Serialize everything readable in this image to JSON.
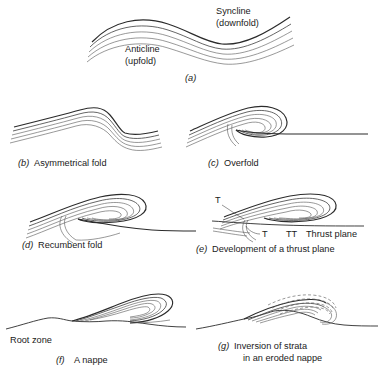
{
  "figure": {
    "background": "#ffffff",
    "ink": "#2b2b2b",
    "panels": [
      {
        "key": "a",
        "tag": "(a)",
        "caption": "",
        "annotations": [
          {
            "name": "syncline",
            "line1": "Syncline",
            "line2": "(downfold)"
          },
          {
            "name": "anticline",
            "line1": "Anticline",
            "line2": "(upfold)"
          }
        ]
      },
      {
        "key": "b",
        "tag": "(b)",
        "caption": "Asymmetrical fold",
        "annotations": []
      },
      {
        "key": "c",
        "tag": "(c)",
        "caption": "Overfold",
        "annotations": []
      },
      {
        "key": "d",
        "tag": "(d)",
        "caption": "Recumbent fold",
        "annotations": []
      },
      {
        "key": "e",
        "tag": "(e)",
        "caption": "Development of a thrust plane",
        "annotations": [
          {
            "name": "thrust-upper",
            "line1": "T",
            "line2": ""
          },
          {
            "name": "thrust-lower",
            "line1": "T",
            "line2": ""
          },
          {
            "name": "thrust-plane",
            "line1": "TT",
            "line2": "Thrust plane"
          }
        ]
      },
      {
        "key": "f",
        "tag": "(f)",
        "caption": "A nappe",
        "annotations": [
          {
            "name": "root-zone",
            "line1": "Root zone",
            "line2": ""
          }
        ]
      },
      {
        "key": "g",
        "tag": "(g)",
        "caption_line1": "Inversion of strata",
        "caption_line2": "in an eroded nappe",
        "annotations": []
      }
    ]
  },
  "labels": {
    "syncline": "Syncline",
    "syncline_sub": "(downfold)",
    "anticline": "Anticline",
    "anticline_sub": "(upfold)",
    "tag_a": "(a)",
    "tag_b": "(b)",
    "cap_b": "Asymmetrical fold",
    "tag_c": "(c)",
    "cap_c": "Overfold",
    "tag_d": "(d)",
    "cap_d": "Recumbent fold",
    "tag_e": "(e)",
    "cap_e": "Development of a thrust plane",
    "t_upper": "T",
    "t_lower": "T",
    "tt": "TT",
    "thrust_plane": "Thrust plane",
    "tag_f": "(f)",
    "cap_f": "A nappe",
    "root_zone": "Root zone",
    "tag_g": "(g)",
    "cap_g1": "Inversion of strata",
    "cap_g2": "in an eroded nappe"
  }
}
